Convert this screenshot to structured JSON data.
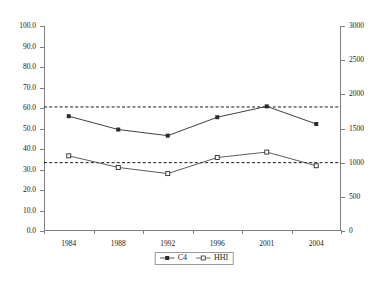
{
  "chart_data": {
    "type": "line",
    "title": "",
    "subtitle": "",
    "xlabel": "",
    "ylabel": "",
    "categories": [
      "1984",
      "1988",
      "1992",
      "1996",
      "2001",
      "2004"
    ],
    "series": [
      {
        "name": "C4",
        "axis": "left",
        "marker": "filled-square",
        "color": "#2b2b2b",
        "values": [
          56.0,
          49.5,
          46.5,
          55.5,
          60.8,
          52.2
        ]
      },
      {
        "name": "HHI",
        "axis": "right",
        "marker": "open-square",
        "color": "#4a4a4a",
        "values": [
          1100,
          930,
          840,
          1075,
          1155,
          955
        ]
      }
    ],
    "reference_lines": [
      {
        "name": "C4-average",
        "axis": "left",
        "value": 60.5,
        "style": "dashed",
        "color": "#1a1a1a"
      },
      {
        "name": "HHI-average",
        "axis": "right",
        "value": 1000,
        "style": "dashed",
        "color": "#1a1a1a"
      }
    ],
    "yaxis_left": {
      "min": 0.0,
      "max": 100.0,
      "step": 10.0,
      "ticks": [
        "0.0",
        "10.0",
        "20.0",
        "30.0",
        "40.0",
        "50.0",
        "60.0",
        "70.0",
        "80.0",
        "90.0",
        "100.0"
      ]
    },
    "yaxis_right": {
      "min": 0,
      "max": 3000,
      "step": 500,
      "ticks": [
        "0",
        "500",
        "1000",
        "1500",
        "2000",
        "2500",
        "3000"
      ]
    },
    "grid": false,
    "legend": {
      "position": "bottom-center",
      "entries": [
        {
          "label": "C4",
          "marker": "filled-square"
        },
        {
          "label": "HHI",
          "marker": "open-square"
        }
      ]
    },
    "axis_color": "#808080",
    "background": "#ffffff"
  }
}
